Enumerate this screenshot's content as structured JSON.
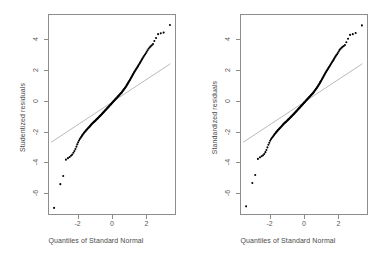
{
  "figure": {
    "background_color": "#ffffff",
    "frame_color": "#8d8d8d",
    "point_color": "#000000",
    "reference_line_color": "#8a8a8a"
  },
  "chart_data": [
    {
      "type": "scatter",
      "title": "",
      "panel": "left",
      "xlabel": "Quantiles of Standard Normal",
      "ylabel": "Studentized residuals",
      "xlim": [
        -3.72,
        3.72
      ],
      "ylim": [
        -7.4,
        5.6
      ],
      "xticks": [
        -2,
        0,
        2
      ],
      "xticklabels": [
        "-2",
        "0",
        "2"
      ],
      "yticks": [
        4,
        2,
        0,
        -2,
        -4,
        -6
      ],
      "yticklabels": [
        "4",
        "2",
        "0",
        "-2",
        "-4",
        "-6"
      ],
      "grid": false,
      "legend": "none",
      "reference_line": {
        "label": "normal reference line",
        "x": [
          -3.6,
          3.45
        ],
        "y": [
          -2.72,
          2.42
        ]
      },
      "x": [
        -3.42,
        -3.05,
        -2.88,
        -2.72,
        -2.6,
        -2.5,
        -2.42,
        -2.35,
        -2.28,
        -2.22,
        -2.16,
        -2.1,
        -2.05,
        -2.0,
        -1.95,
        -1.9,
        -1.85,
        -1.81,
        -1.77,
        -1.73,
        -1.69,
        -1.65,
        -1.61,
        -1.57,
        -1.54,
        -1.5,
        -1.47,
        -1.43,
        -1.4,
        -1.37,
        -1.33,
        -1.3,
        -1.27,
        -1.24,
        -1.21,
        -1.18,
        -1.15,
        -1.12,
        -1.09,
        -1.06,
        -1.03,
        -1.0,
        -0.97,
        -0.95,
        -0.92,
        -0.89,
        -0.86,
        -0.84,
        -0.81,
        -0.78,
        -0.76,
        -0.73,
        -0.7,
        -0.68,
        -0.65,
        -0.62,
        -0.6,
        -0.57,
        -0.55,
        -0.52,
        -0.5,
        -0.47,
        -0.45,
        -0.42,
        -0.4,
        -0.37,
        -0.35,
        -0.32,
        -0.3,
        -0.27,
        -0.25,
        -0.22,
        -0.2,
        -0.17,
        -0.15,
        -0.12,
        -0.1,
        -0.07,
        -0.05,
        -0.02,
        0.0,
        0.02,
        0.05,
        0.07,
        0.1,
        0.12,
        0.15,
        0.17,
        0.2,
        0.22,
        0.25,
        0.27,
        0.3,
        0.32,
        0.35,
        0.37,
        0.4,
        0.42,
        0.45,
        0.47,
        0.5,
        0.52,
        0.55,
        0.57,
        0.6,
        0.62,
        0.65,
        0.68,
        0.7,
        0.73,
        0.76,
        0.78,
        0.81,
        0.84,
        0.86,
        0.89,
        0.92,
        0.95,
        0.97,
        1.0,
        1.03,
        1.06,
        1.09,
        1.12,
        1.15,
        1.18,
        1.21,
        1.24,
        1.27,
        1.3,
        1.33,
        1.37,
        1.4,
        1.43,
        1.47,
        1.5,
        1.54,
        1.57,
        1.61,
        1.65,
        1.69,
        1.73,
        1.77,
        1.81,
        1.85,
        1.9,
        1.95,
        2.0,
        2.05,
        2.1,
        2.16,
        2.22,
        2.28,
        2.35,
        2.42,
        2.5,
        2.6,
        2.72,
        2.88,
        3.05,
        3.42
      ],
      "y": [
        -7.0,
        -5.45,
        -4.92,
        -3.85,
        -3.75,
        -3.68,
        -3.6,
        -3.52,
        -3.4,
        -3.28,
        -3.15,
        -3.0,
        -2.85,
        -2.72,
        -2.6,
        -2.5,
        -2.42,
        -2.35,
        -2.28,
        -2.22,
        -2.16,
        -2.1,
        -2.04,
        -1.99,
        -1.94,
        -1.9,
        -1.86,
        -1.82,
        -1.78,
        -1.74,
        -1.7,
        -1.66,
        -1.62,
        -1.58,
        -1.54,
        -1.5,
        -1.47,
        -1.44,
        -1.41,
        -1.38,
        -1.35,
        -1.32,
        -1.29,
        -1.26,
        -1.23,
        -1.2,
        -1.17,
        -1.14,
        -1.11,
        -1.08,
        -1.05,
        -1.02,
        -0.99,
        -0.96,
        -0.93,
        -0.9,
        -0.87,
        -0.84,
        -0.81,
        -0.78,
        -0.75,
        -0.72,
        -0.69,
        -0.66,
        -0.63,
        -0.6,
        -0.57,
        -0.54,
        -0.51,
        -0.48,
        -0.45,
        -0.42,
        -0.39,
        -0.36,
        -0.33,
        -0.3,
        -0.27,
        -0.24,
        -0.21,
        -0.18,
        -0.15,
        -0.12,
        -0.09,
        -0.06,
        -0.03,
        0.0,
        0.03,
        0.06,
        0.09,
        0.12,
        0.15,
        0.18,
        0.21,
        0.24,
        0.27,
        0.3,
        0.33,
        0.36,
        0.39,
        0.42,
        0.45,
        0.48,
        0.51,
        0.54,
        0.58,
        0.62,
        0.66,
        0.7,
        0.74,
        0.78,
        0.82,
        0.86,
        0.9,
        0.95,
        1.0,
        1.05,
        1.1,
        1.15,
        1.2,
        1.25,
        1.3,
        1.36,
        1.42,
        1.48,
        1.54,
        1.6,
        1.66,
        1.72,
        1.78,
        1.84,
        1.9,
        1.96,
        2.02,
        2.08,
        2.14,
        2.2,
        2.26,
        2.33,
        2.4,
        2.47,
        2.55,
        2.62,
        2.7,
        2.78,
        2.86,
        2.94,
        3.02,
        3.1,
        3.2,
        3.3,
        3.4,
        3.48,
        3.55,
        3.62,
        3.7,
        3.9,
        4.1,
        4.35,
        4.4,
        4.45,
        4.95
      ]
    },
    {
      "type": "scatter",
      "title": "",
      "panel": "right",
      "xlabel": "Quantiles of Standard Normal",
      "ylabel": "Standardized residuals",
      "xlim": [
        -3.72,
        3.72
      ],
      "ylim": [
        -7.4,
        5.6
      ],
      "xticks": [
        -2,
        0,
        2
      ],
      "xticklabels": [
        "-2",
        "0",
        "2"
      ],
      "yticks": [
        4,
        2,
        0,
        -2,
        -4,
        -6
      ],
      "yticklabels": [
        "4",
        "2",
        "0",
        "-2",
        "-4",
        "-6"
      ],
      "grid": false,
      "legend": "none",
      "reference_line": {
        "label": "normal reference line",
        "x": [
          -3.6,
          3.45
        ],
        "y": [
          -2.72,
          2.42
        ]
      },
      "x": [
        -3.42,
        -3.05,
        -2.88,
        -2.72,
        -2.6,
        -2.5,
        -2.42,
        -2.35,
        -2.28,
        -2.22,
        -2.16,
        -2.1,
        -2.05,
        -2.0,
        -1.95,
        -1.9,
        -1.85,
        -1.81,
        -1.77,
        -1.73,
        -1.69,
        -1.65,
        -1.61,
        -1.57,
        -1.54,
        -1.5,
        -1.47,
        -1.43,
        -1.4,
        -1.37,
        -1.33,
        -1.3,
        -1.27,
        -1.24,
        -1.21,
        -1.18,
        -1.15,
        -1.12,
        -1.09,
        -1.06,
        -1.03,
        -1.0,
        -0.97,
        -0.95,
        -0.92,
        -0.89,
        -0.86,
        -0.84,
        -0.81,
        -0.78,
        -0.76,
        -0.73,
        -0.7,
        -0.68,
        -0.65,
        -0.62,
        -0.6,
        -0.57,
        -0.55,
        -0.52,
        -0.5,
        -0.47,
        -0.45,
        -0.42,
        -0.4,
        -0.37,
        -0.35,
        -0.32,
        -0.3,
        -0.27,
        -0.25,
        -0.22,
        -0.2,
        -0.17,
        -0.15,
        -0.12,
        -0.1,
        -0.07,
        -0.05,
        -0.02,
        0.0,
        0.02,
        0.05,
        0.07,
        0.1,
        0.12,
        0.15,
        0.17,
        0.2,
        0.22,
        0.25,
        0.27,
        0.3,
        0.32,
        0.35,
        0.37,
        0.4,
        0.42,
        0.45,
        0.47,
        0.5,
        0.52,
        0.55,
        0.57,
        0.6,
        0.62,
        0.65,
        0.68,
        0.7,
        0.73,
        0.76,
        0.78,
        0.81,
        0.84,
        0.86,
        0.89,
        0.92,
        0.95,
        0.97,
        1.0,
        1.03,
        1.06,
        1.09,
        1.12,
        1.15,
        1.18,
        1.21,
        1.24,
        1.27,
        1.3,
        1.33,
        1.37,
        1.4,
        1.43,
        1.47,
        1.5,
        1.54,
        1.57,
        1.61,
        1.65,
        1.69,
        1.73,
        1.77,
        1.81,
        1.85,
        1.9,
        1.95,
        2.0,
        2.05,
        2.1,
        2.16,
        2.22,
        2.28,
        2.35,
        2.42,
        2.5,
        2.6,
        2.72,
        2.88,
        3.05,
        3.42
      ],
      "y": [
        -6.9,
        -5.38,
        -4.85,
        -3.8,
        -3.7,
        -3.63,
        -3.56,
        -3.48,
        -3.36,
        -3.22,
        -3.05,
        -2.88,
        -2.74,
        -2.62,
        -2.52,
        -2.44,
        -2.37,
        -2.3,
        -2.24,
        -2.18,
        -2.12,
        -2.07,
        -2.02,
        -1.97,
        -1.92,
        -1.88,
        -1.84,
        -1.8,
        -1.76,
        -1.72,
        -1.68,
        -1.64,
        -1.6,
        -1.56,
        -1.53,
        -1.49,
        -1.46,
        -1.43,
        -1.4,
        -1.37,
        -1.34,
        -1.31,
        -1.28,
        -1.25,
        -1.22,
        -1.19,
        -1.16,
        -1.13,
        -1.1,
        -1.07,
        -1.04,
        -1.01,
        -0.98,
        -0.95,
        -0.92,
        -0.89,
        -0.86,
        -0.83,
        -0.8,
        -0.77,
        -0.74,
        -0.71,
        -0.68,
        -0.65,
        -0.62,
        -0.59,
        -0.56,
        -0.53,
        -0.5,
        -0.47,
        -0.44,
        -0.41,
        -0.38,
        -0.35,
        -0.32,
        -0.29,
        -0.26,
        -0.23,
        -0.2,
        -0.17,
        -0.14,
        -0.11,
        -0.08,
        -0.05,
        -0.02,
        0.01,
        0.04,
        0.07,
        0.1,
        0.13,
        0.16,
        0.19,
        0.22,
        0.25,
        0.28,
        0.31,
        0.34,
        0.37,
        0.4,
        0.43,
        0.46,
        0.49,
        0.52,
        0.56,
        0.6,
        0.64,
        0.68,
        0.72,
        0.76,
        0.8,
        0.84,
        0.88,
        0.93,
        0.98,
        1.03,
        1.08,
        1.13,
        1.18,
        1.23,
        1.28,
        1.34,
        1.4,
        1.46,
        1.52,
        1.58,
        1.64,
        1.7,
        1.76,
        1.82,
        1.88,
        1.94,
        2.0,
        2.06,
        2.12,
        2.18,
        2.24,
        2.3,
        2.37,
        2.44,
        2.51,
        2.58,
        2.65,
        2.72,
        2.8,
        2.88,
        2.96,
        3.04,
        3.12,
        3.22,
        3.32,
        3.4,
        3.46,
        3.52,
        3.58,
        3.64,
        3.82,
        4.05,
        4.3,
        4.35,
        4.42,
        4.92
      ]
    }
  ]
}
